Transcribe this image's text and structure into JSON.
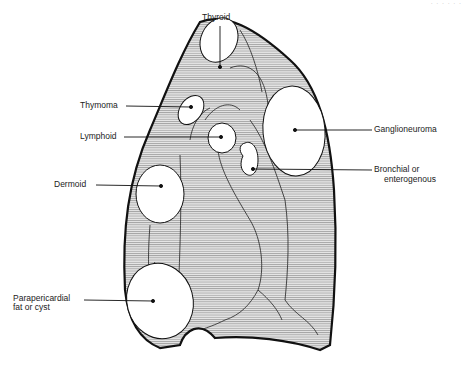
{
  "figure": {
    "header_fragment": "· · · · · ·",
    "labels": {
      "thyroid": "Thyroid",
      "thymoma": "Thymoma",
      "lymphoid": "Lymphoid",
      "dermoid": "Dermoid",
      "parapericardial_line1": "Parapericardial",
      "parapericardial_line2": "fat or cyst",
      "ganglioneuroma": "Ganglioneuroma",
      "bronchial_line1": "Bronchial or",
      "bronchial_line2": "enterogenous"
    },
    "colors": {
      "outline": "#111111",
      "hatch": "#777777",
      "fill": "#e6e6e6",
      "mass": "#ffffff"
    }
  }
}
